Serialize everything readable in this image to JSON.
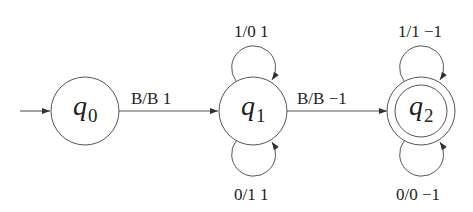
{
  "diagram": {
    "type": "finite-state-machine",
    "start_state": "q0",
    "accepting_states": [
      "q2"
    ],
    "states": [
      {
        "id": "q0",
        "letter": "q",
        "sub": "0"
      },
      {
        "id": "q1",
        "letter": "q",
        "sub": "1"
      },
      {
        "id": "q2",
        "letter": "q",
        "sub": "2"
      }
    ],
    "transitions": [
      {
        "from": "q0",
        "to": "q1",
        "label": "B/B 1"
      },
      {
        "from": "q1",
        "to": "q1",
        "label": "1/0 1",
        "position": "top"
      },
      {
        "from": "q1",
        "to": "q1",
        "label": "0/1 1",
        "position": "bottom"
      },
      {
        "from": "q1",
        "to": "q2",
        "label": "B/B −1"
      },
      {
        "from": "q2",
        "to": "q2",
        "label": "1/1 −1",
        "position": "top"
      },
      {
        "from": "q2",
        "to": "q2",
        "label": "0/0 −1",
        "position": "bottom"
      }
    ]
  }
}
